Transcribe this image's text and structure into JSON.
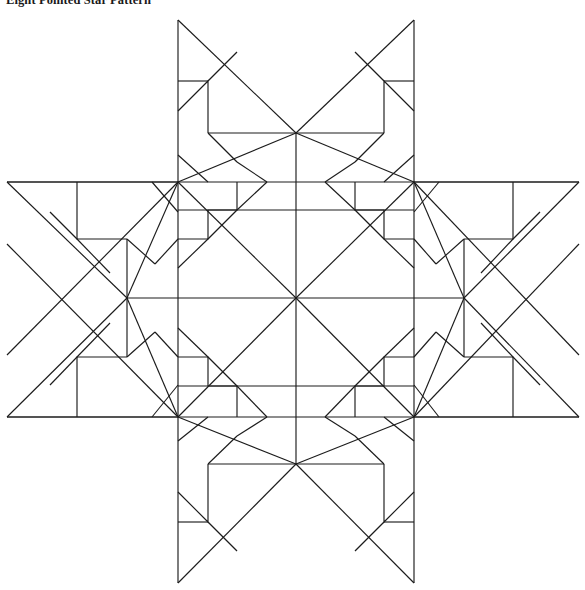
{
  "document": {
    "title": "Eight Pointed Star Pattern",
    "background_color": "#ffffff",
    "line_color": "#1c1c1c"
  },
  "figure": {
    "name": "eight-pointed-star-quilt-diagram",
    "frame": {
      "x": 7,
      "y": 20,
      "width": 572,
      "height": 563
    },
    "grid": {
      "columns_x": [
        7,
        178,
        414,
        579
      ],
      "rows_y": [
        20,
        182,
        417,
        583
      ],
      "block_layout": [
        [
          "empty-corner",
          "star-block-top",
          "empty-corner"
        ],
        [
          "star-block-left",
          "star-block-center",
          "star-block-right"
        ],
        [
          "empty-corner",
          "star-block-bottom",
          "empty-corner"
        ]
      ]
    },
    "star_centers": [
      {
        "name": "star-center-top",
        "x": 296,
        "y": 133
      },
      {
        "name": "star-center-left",
        "x": 127,
        "y": 298
      },
      {
        "name": "star-center-middle",
        "x": 296,
        "y": 298
      },
      {
        "name": "star-center-right",
        "x": 464,
        "y": 298
      },
      {
        "name": "star-center-bottom",
        "x": 296,
        "y": 464
      }
    ],
    "symmetry": "4-fold rotational (90 degrees) about center",
    "points_per_star": 8
  }
}
